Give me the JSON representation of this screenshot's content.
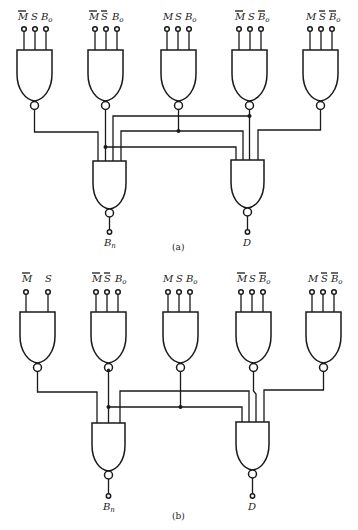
{
  "diagram": {
    "type": "logic-circuit",
    "gate_type": "NAND",
    "parts": [
      {
        "caption": "(a)",
        "input_gates": [
          {
            "inputs": [
              {
                "name": "M",
                "bar": true
              },
              {
                "name": "S",
                "bar": false
              },
              {
                "name": "B",
                "sub": "o",
                "bar": false
              }
            ]
          },
          {
            "inputs": [
              {
                "name": "M",
                "bar": true
              },
              {
                "name": "S",
                "bar": true
              },
              {
                "name": "B",
                "sub": "o",
                "bar": false
              }
            ]
          },
          {
            "inputs": [
              {
                "name": "M",
                "bar": false
              },
              {
                "name": "S",
                "bar": false
              },
              {
                "name": "B",
                "sub": "o",
                "bar": false
              }
            ]
          },
          {
            "inputs": [
              {
                "name": "M",
                "bar": true
              },
              {
                "name": "S",
                "bar": false
              },
              {
                "name": "B",
                "sub": "o",
                "bar": true
              }
            ]
          },
          {
            "inputs": [
              {
                "name": "M",
                "bar": false
              },
              {
                "name": "S",
                "bar": true
              },
              {
                "name": "B",
                "sub": "o",
                "bar": true
              }
            ]
          }
        ],
        "outputs": [
          {
            "name": "B",
            "sub": "n",
            "fed_by": [
              1,
              2,
              3,
              4
            ]
          },
          {
            "name": "D",
            "fed_by": [
              2,
              3,
              4,
              5
            ]
          }
        ]
      },
      {
        "caption": "(b)",
        "input_gates": [
          {
            "inputs": [
              {
                "name": "M",
                "bar": true
              },
              {
                "name": "S",
                "bar": false
              }
            ]
          },
          {
            "inputs": [
              {
                "name": "M",
                "bar": true
              },
              {
                "name": "S",
                "bar": true
              },
              {
                "name": "B",
                "sub": "o",
                "bar": false
              }
            ]
          },
          {
            "inputs": [
              {
                "name": "M",
                "bar": false
              },
              {
                "name": "S",
                "bar": false
              },
              {
                "name": "B",
                "sub": "o",
                "bar": false
              }
            ]
          },
          {
            "inputs": [
              {
                "name": "M",
                "bar": true
              },
              {
                "name": "S",
                "bar": false
              },
              {
                "name": "B",
                "sub": "o",
                "bar": true
              }
            ]
          },
          {
            "inputs": [
              {
                "name": "M",
                "bar": false
              },
              {
                "name": "S",
                "bar": true
              },
              {
                "name": "B",
                "sub": "o",
                "bar": true
              }
            ]
          }
        ],
        "outputs": [
          {
            "name": "B",
            "sub": "n",
            "fed_by": [
              1,
              2,
              3
            ]
          },
          {
            "name": "D",
            "fed_by": [
              2,
              3,
              4,
              5
            ]
          }
        ]
      }
    ]
  },
  "labels": {
    "a": {
      "caption": "(a)",
      "out1": "B",
      "out1_sub": "n",
      "out2": "D"
    },
    "b": {
      "caption": "(b)",
      "out1": "B",
      "out1_sub": "n",
      "out2": "D"
    },
    "M": "M",
    "S": "S",
    "B": "B",
    "o": "o"
  }
}
